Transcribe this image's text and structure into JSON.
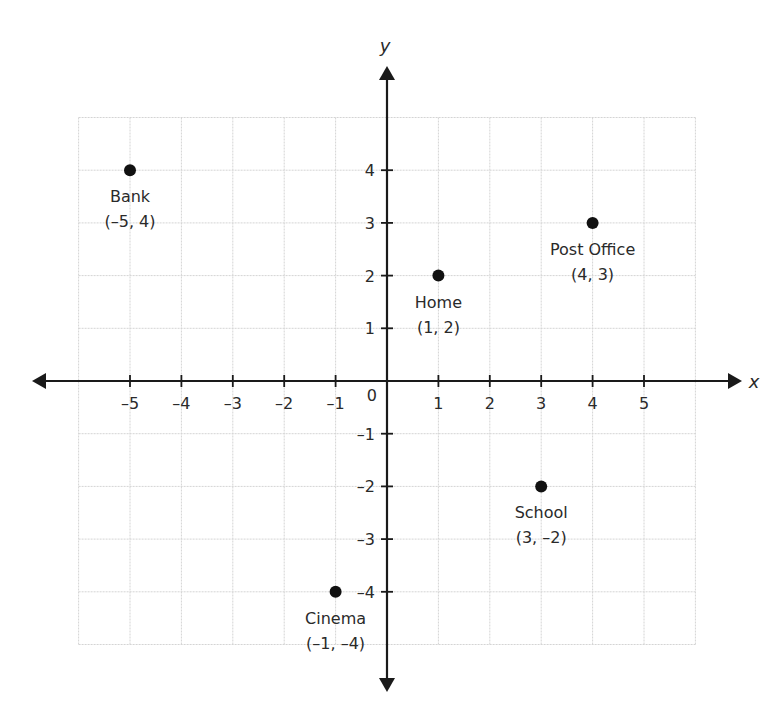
{
  "chart_data": {
    "type": "scatter",
    "title": "",
    "xlabel": "x",
    "ylabel": "y",
    "xlim": [
      -6,
      6
    ],
    "ylim": [
      -5,
      5
    ],
    "grid": true,
    "x_ticks": [
      -5,
      -4,
      -3,
      -2,
      -1,
      1,
      2,
      3,
      4,
      5
    ],
    "y_ticks": [
      -4,
      -3,
      -2,
      -1,
      1,
      2,
      3,
      4
    ],
    "origin_label": "0",
    "points": [
      {
        "name": "Bank",
        "x": -5,
        "y": 4,
        "label": "(–5, 4)"
      },
      {
        "name": "Home",
        "x": 1,
        "y": 2,
        "label": "(1, 2)"
      },
      {
        "name": "Post Office",
        "x": 4,
        "y": 3,
        "label": "(4, 3)"
      },
      {
        "name": "School",
        "x": 3,
        "y": -2,
        "label": "(3, –2)"
      },
      {
        "name": "Cinema",
        "x": -1,
        "y": -4,
        "label": "(–1, –4)"
      }
    ]
  },
  "colors": {
    "axis": "#1a1a1a",
    "grid": "#d4d4d4",
    "point": "#111111",
    "text": "#2a2a2a"
  }
}
